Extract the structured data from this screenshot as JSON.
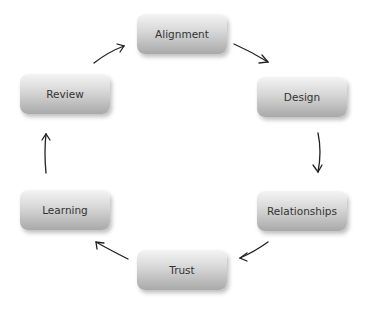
{
  "diagram": {
    "type": "cycle",
    "nodes": [
      {
        "id": "alignment",
        "label": "Alignment"
      },
      {
        "id": "design",
        "label": "Design"
      },
      {
        "id": "relationships",
        "label": "Relationships"
      },
      {
        "id": "trust",
        "label": "Trust"
      },
      {
        "id": "learning",
        "label": "Learning"
      },
      {
        "id": "review",
        "label": "Review"
      }
    ],
    "edges": [
      {
        "from": "alignment",
        "to": "design"
      },
      {
        "from": "design",
        "to": "relationships"
      },
      {
        "from": "relationships",
        "to": "trust"
      },
      {
        "from": "trust",
        "to": "learning"
      },
      {
        "from": "learning",
        "to": "review"
      },
      {
        "from": "review",
        "to": "alignment"
      }
    ],
    "colors": {
      "box_top": "#f4f4f4",
      "box_bottom": "#a9a9a9",
      "text": "#333333",
      "arrow": "#222222"
    }
  }
}
